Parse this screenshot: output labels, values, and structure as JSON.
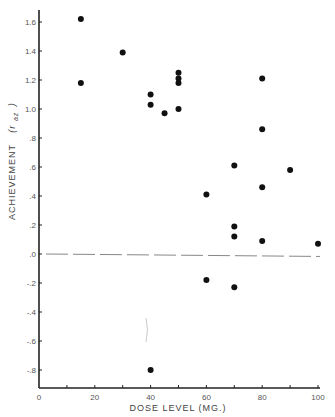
{
  "chart_data": {
    "type": "scatter",
    "title": "",
    "xlabel": "DOSE LEVEL (MG.)",
    "ylabel": "ACHIEVEMENT (r_az)",
    "ylabel_main": "ACHIEVEMENT",
    "ylabel_symbol": "(r",
    "ylabel_subscript": "az",
    "ylabel_close": ")",
    "xlim": [
      0,
      100
    ],
    "ylim": [
      -0.9,
      1.7
    ],
    "x_ticks": [
      0,
      10,
      20,
      30,
      40,
      50,
      60,
      70,
      80,
      90,
      100
    ],
    "x_tick_labels": [
      {
        "value": 0,
        "label": "0"
      },
      {
        "value": 20,
        "label": "20"
      },
      {
        "value": 40,
        "label": "40"
      },
      {
        "value": 60,
        "label": "60"
      },
      {
        "value": 80,
        "label": "80"
      },
      {
        "value": 100,
        "label": "100"
      }
    ],
    "y_tick_labels": [
      {
        "value": 1.6,
        "label": "1.6"
      },
      {
        "value": 1.4,
        "label": "1.4"
      },
      {
        "value": 1.2,
        "label": "1.2"
      },
      {
        "value": 1.0,
        "label": "1.0"
      },
      {
        "value": 0.8,
        "label": ".8"
      },
      {
        "value": 0.6,
        "label": ".6"
      },
      {
        "value": 0.4,
        "label": ".4"
      },
      {
        "value": 0.2,
        "label": ".2"
      },
      {
        "value": 0.0,
        "label": ".0"
      },
      {
        "value": -0.2,
        "label": "-.2"
      },
      {
        "value": -0.4,
        "label": "-.4"
      },
      {
        "value": -0.6,
        "label": "-.6"
      },
      {
        "value": -0.8,
        "label": "-.8"
      }
    ],
    "grid": false,
    "legend": null,
    "reference_line": {
      "style": "dashed",
      "y_start": 0.0,
      "y_end": -0.01,
      "color": "#888888"
    },
    "point_color": "#111111",
    "series": [
      {
        "name": "Subjects",
        "points": [
          {
            "x": 15,
            "y": 1.62
          },
          {
            "x": 15,
            "y": 1.18
          },
          {
            "x": 30,
            "y": 1.39
          },
          {
            "x": 40,
            "y": 1.1
          },
          {
            "x": 40,
            "y": 1.03
          },
          {
            "x": 40,
            "y": -0.8
          },
          {
            "x": 45,
            "y": 0.97
          },
          {
            "x": 50,
            "y": 1.25
          },
          {
            "x": 50,
            "y": 1.21
          },
          {
            "x": 50,
            "y": 1.18
          },
          {
            "x": 50,
            "y": 1.0
          },
          {
            "x": 60,
            "y": 0.41
          },
          {
            "x": 60,
            "y": -0.18
          },
          {
            "x": 70,
            "y": 0.61
          },
          {
            "x": 70,
            "y": 0.19
          },
          {
            "x": 70,
            "y": 0.12
          },
          {
            "x": 70,
            "y": -0.23
          },
          {
            "x": 80,
            "y": 1.21
          },
          {
            "x": 80,
            "y": 0.86
          },
          {
            "x": 80,
            "y": 0.46
          },
          {
            "x": 80,
            "y": 0.09
          },
          {
            "x": 90,
            "y": 0.58
          },
          {
            "x": 100,
            "y": 0.07
          }
        ]
      }
    ]
  }
}
